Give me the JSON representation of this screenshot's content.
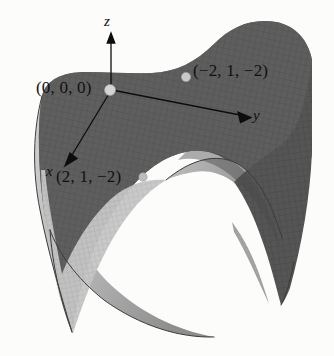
{
  "figure": {
    "type": "3d-surface-plot",
    "background_color": "#fcfcfb",
    "surface": {
      "name": "saddle-surface",
      "shading": {
        "dark_gray": "#5c5c5c",
        "mid_gray": "#6e6e6e",
        "light_gray": "#a8a8a8",
        "pale_gray": "#c9c9c9",
        "edge_gray": "#3f3f3f"
      },
      "mesh_line_color": "#4a4a4a"
    },
    "axes": {
      "color": "#101010",
      "origin_px": {
        "x": 110,
        "y": 90
      },
      "items": [
        {
          "name": "z",
          "label": "z",
          "tip_px": {
            "x": 111,
            "y": 36
          }
        },
        {
          "name": "y",
          "label": "y",
          "tip_px": {
            "x": 249,
            "y": 117
          }
        },
        {
          "name": "x",
          "label": "x",
          "tip_px": {
            "x": 66,
            "y": 163
          }
        }
      ]
    },
    "points": [
      {
        "name": "origin",
        "label": "(0, 0, 0)",
        "marker_px": {
          "x": 110,
          "y": 90
        },
        "marker_color": "#d2d2d2"
      },
      {
        "name": "point-neg2-1-neg2",
        "label": "(−2, 1, −2)",
        "marker_px": {
          "x": 186,
          "y": 77
        },
        "marker_color": "#c9c9c9"
      },
      {
        "name": "point-2-1-neg2",
        "label": "(2, 1, −2)",
        "marker_px": {
          "x": 143,
          "y": 177
        },
        "marker_color": "#bdbdbd"
      }
    ]
  }
}
